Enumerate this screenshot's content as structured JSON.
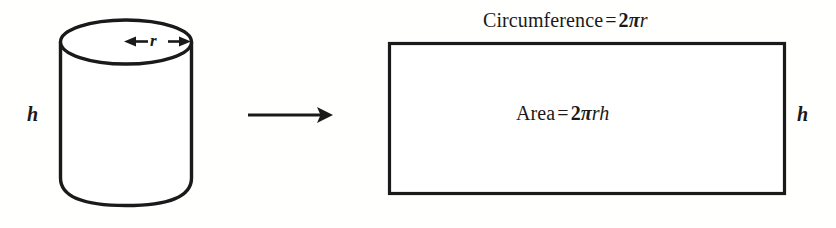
{
  "diagram": {
    "stroke_color": "#1a1a1a",
    "background_color": "#ffffff",
    "cylinder": {
      "height_label": "h",
      "radius_label": "r",
      "radius_arrow": "double-headed-arrow"
    },
    "transform_arrow": {
      "icon": "right-arrow-icon",
      "direction": "right"
    },
    "rectangle": {
      "height_label": "h",
      "top_label": {
        "text": "Circumference = 2πr",
        "lead": "Circumference",
        "equals": "=",
        "coefficient": "2",
        "pi": "π",
        "variables": "r"
      },
      "inner_label": {
        "text": "Area = 2πrh",
        "lead": "Area",
        "equals": "=",
        "coefficient": "2",
        "pi": "π",
        "variables": "rh"
      }
    }
  }
}
